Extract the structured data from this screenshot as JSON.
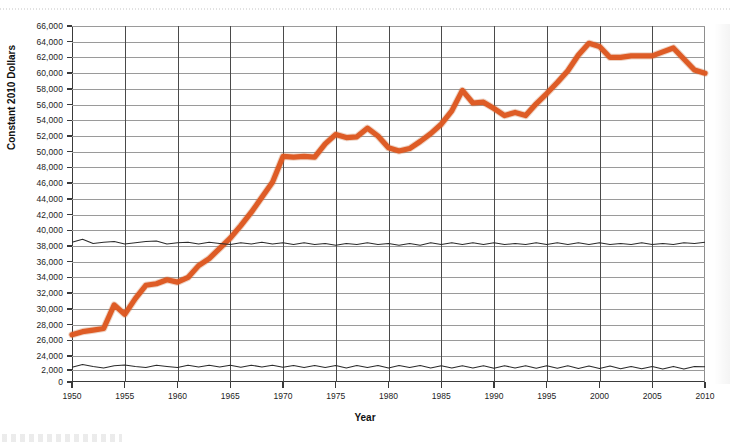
{
  "figure": {
    "y_axis_title": "Constant 2010 Dollars",
    "x_axis_title": "Year",
    "accent_color": "#DD561F",
    "thin_line_color": "#2B2B2B",
    "gridline_color": "#9A9A9A"
  },
  "chart_data": {
    "type": "line",
    "title": "",
    "subtitle": "",
    "xlabel": "Year",
    "ylabel": "Constant 2010 Dollars",
    "xlim": [
      1950,
      2010
    ],
    "ylim": [
      0,
      66000
    ],
    "grid": true,
    "legend_position": "none",
    "axis_break": {
      "present": true,
      "below": 2000,
      "above": 24000,
      "note": "Y axis is broken: ticks run 0, 2,000 then resume at 24,000"
    },
    "xticks": [
      1950,
      1955,
      1960,
      1965,
      1970,
      1975,
      1980,
      1985,
      1990,
      1995,
      2000,
      2005,
      2010
    ],
    "xtick_labels": [
      "1950",
      "1955",
      "1960",
      "1965",
      "1970",
      "1975",
      "1980",
      "1985",
      "1990",
      "1995",
      "2000",
      "2005",
      "2010"
    ],
    "yticks": [
      0,
      2000,
      24000,
      26000,
      28000,
      30000,
      32000,
      34000,
      36000,
      38000,
      40000,
      42000,
      44000,
      46000,
      48000,
      50000,
      52000,
      54000,
      56000,
      58000,
      60000,
      62000,
      64000,
      66000
    ],
    "ytick_labels": [
      "0",
      "2,000",
      "24,000",
      "26,000",
      "28,000",
      "30,000",
      "32,000",
      "34,000",
      "36,000",
      "38,000",
      "40,000",
      "42,000",
      "44,000",
      "46,000",
      "48,000",
      "50,000",
      "52,000",
      "54,000",
      "56,000",
      "58,000",
      "60,000",
      "62,000",
      "64,000",
      "66,000"
    ],
    "x": [
      1950,
      1951,
      1952,
      1953,
      1954,
      1955,
      1956,
      1957,
      1958,
      1959,
      1960,
      1961,
      1962,
      1963,
      1964,
      1965,
      1966,
      1967,
      1968,
      1969,
      1970,
      1971,
      1972,
      1973,
      1974,
      1975,
      1976,
      1977,
      1978,
      1979,
      1980,
      1981,
      1982,
      1983,
      1984,
      1985,
      1986,
      1987,
      1988,
      1989,
      1990,
      1991,
      1992,
      1993,
      1994,
      1995,
      1996,
      1997,
      1998,
      1999,
      2000,
      2001,
      2002,
      2003,
      2004,
      2005,
      2006,
      2007,
      2008,
      2009,
      2010
    ],
    "series": [
      {
        "name": "Median family income",
        "color": "#DD561F",
        "emphasis": "primary",
        "values": [
          26700,
          27100,
          27300,
          27500,
          30500,
          29300,
          31300,
          33000,
          33200,
          33700,
          33400,
          34000,
          35500,
          36400,
          37700,
          39000,
          40600,
          42300,
          44200,
          46100,
          49400,
          49300,
          49400,
          49300,
          51000,
          52200,
          51800,
          51900,
          53000,
          52000,
          50500,
          50100,
          50400,
          51300,
          52300,
          53500,
          55200,
          57800,
          56200,
          56300,
          55500,
          54600,
          55000,
          54600,
          56100,
          57400,
          58800,
          60300,
          62300,
          63800,
          63400,
          62000,
          62000,
          62200,
          62200,
          62200,
          62700,
          63200,
          61800,
          60400,
          60000
        ]
      },
      {
        "name": "Lower auxiliary series (upper thin line)",
        "color": "#2B2B2B",
        "emphasis": "secondary",
        "values": [
          23300,
          23800,
          23100,
          23300,
          23400,
          23000,
          23200,
          23400,
          23500,
          23000,
          23200,
          23300,
          23000,
          23300,
          23100,
          22900,
          23200,
          23000,
          23300,
          23000,
          23200,
          22900,
          23200,
          22900,
          23100,
          22800,
          23100,
          22900,
          23200,
          22900,
          23100,
          22800,
          23100,
          22800,
          23200,
          22900,
          23200,
          22900,
          23200,
          22900,
          23200,
          22900,
          23100,
          22900,
          23200,
          22900,
          23200,
          22900,
          23200,
          22900,
          23200,
          22900,
          23100,
          22900,
          23200,
          22900,
          23100,
          22900,
          23200,
          23100,
          23300
        ]
      },
      {
        "name": "Lower auxiliary series (lower thin line)",
        "color": "#2B2B2B",
        "emphasis": "secondary",
        "values": [
          2450,
          2900,
          2600,
          2350,
          2700,
          2850,
          2600,
          2400,
          2800,
          2600,
          2400,
          2800,
          2500,
          2800,
          2500,
          2800,
          2450,
          2800,
          2500,
          2800,
          2450,
          2750,
          2400,
          2750,
          2400,
          2750,
          2350,
          2750,
          2400,
          2750,
          2350,
          2750,
          2400,
          2750,
          2350,
          2700,
          2350,
          2700,
          2350,
          2700,
          2300,
          2700,
          2350,
          2700,
          2300,
          2700,
          2300,
          2700,
          2250,
          2650,
          2250,
          2650,
          2200,
          2600,
          2200,
          2600,
          2150,
          2600,
          2150,
          2600,
          2550
        ]
      }
    ]
  }
}
